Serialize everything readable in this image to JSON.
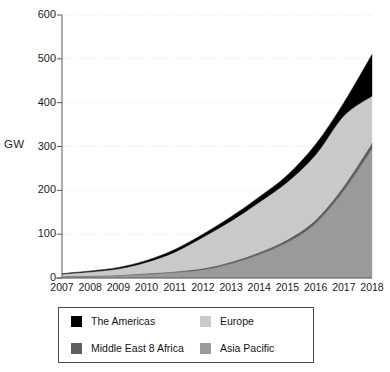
{
  "axis": {
    "y_label": "GW",
    "y_ticks": [
      "600",
      "500",
      "400",
      "300",
      "200",
      "100",
      "0"
    ],
    "x_ticks": [
      "2007",
      "2008",
      "2009",
      "2010",
      "2011",
      "2012",
      "2013",
      "2014",
      "2015",
      "2016",
      "2017",
      "2018"
    ]
  },
  "legend": {
    "items": [
      {
        "label": "The Americas",
        "color": "#000000"
      },
      {
        "label": "Europe",
        "color": "#c9c9c9"
      },
      {
        "label": "Middle East 8 Africa",
        "color": "#5e5e5e"
      },
      {
        "label": "Asia Pacific",
        "color": "#9a9a9a"
      }
    ]
  },
  "chart_data": {
    "type": "area",
    "stacked": true,
    "title": "",
    "xlabel": "",
    "ylabel": "GW",
    "ylim": [
      0,
      600
    ],
    "yticks": [
      0,
      100,
      200,
      300,
      400,
      500,
      600
    ],
    "grid": true,
    "legend_position": "bottom",
    "categories": [
      "2007",
      "2008",
      "2009",
      "2010",
      "2011",
      "2012",
      "2013",
      "2014",
      "2015",
      "2016",
      "2017",
      "2018"
    ],
    "series": [
      {
        "name": "Asia Pacific",
        "color": "#9a9a9a",
        "values": [
          3,
          4,
          6,
          9,
          13,
          19,
          33,
          54,
          82,
          125,
          200,
          295
        ]
      },
      {
        "name": "Middle East 8 Africa",
        "color": "#5e5e5e",
        "values": [
          1,
          1,
          1,
          2,
          2,
          3,
          4,
          5,
          6,
          8,
          10,
          13
        ]
      },
      {
        "name": "Europe",
        "color": "#c9c9c9",
        "values": [
          5,
          9,
          14,
          25,
          44,
          71,
          93,
          114,
          131,
          148,
          160,
          107
        ]
      },
      {
        "name": "The Americas",
        "color": "#000000",
        "values": [
          1,
          2,
          3,
          4,
          6,
          7,
          10,
          12,
          16,
          24,
          30,
          95
        ]
      }
    ],
    "totals": [
      10,
      16,
      24,
      40,
      65,
      100,
      140,
      185,
      235,
      305,
      400,
      510
    ]
  }
}
